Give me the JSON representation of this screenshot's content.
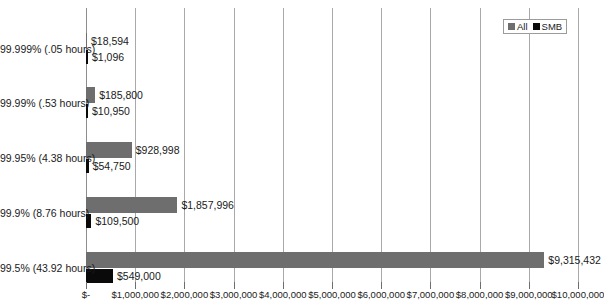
{
  "chart_data": {
    "type": "bar",
    "orientation": "horizontal",
    "title": "",
    "xlabel": "",
    "ylabel": "",
    "xlim": [
      0,
      10000000
    ],
    "grid": true,
    "legend_position": "top-right",
    "categories": [
      "99.999% (.05 hours)",
      "99.99% (.53 hours)",
      "99.95% (4.38 hours)",
      "99.9% (8.76 hours)",
      "99.5% (43.92 hours)"
    ],
    "xticks": [
      0,
      1000000,
      2000000,
      3000000,
      4000000,
      5000000,
      6000000,
      7000000,
      8000000,
      9000000,
      10000000
    ],
    "xticklabels": [
      "$-",
      "$1,000,000",
      "$2,000,000",
      "$3,000,000",
      "$4,000,000",
      "$5,000,000",
      "$6,000,000",
      "$7,000,000",
      "$8,000,000",
      "$9,000,000",
      "$10,000,000"
    ],
    "series": [
      {
        "name": "All",
        "color": "#6e6e6e",
        "values": [
          18594,
          185800,
          928998,
          1857996,
          9315432
        ],
        "labels": [
          "$18,594",
          "$185,800",
          "$928,998",
          "$1,857,996",
          "$9,315,432"
        ]
      },
      {
        "name": "SMB",
        "color": "#0a0a0a",
        "values": [
          1096,
          10950,
          54750,
          109500,
          549000
        ],
        "labels": [
          "$1,096",
          "$10,950",
          "$54,750",
          "$109,500",
          "$549,000"
        ]
      }
    ]
  },
  "legend": {
    "items": [
      {
        "label": "All",
        "color": "#6e6e6e"
      },
      {
        "label": "SMB",
        "color": "#0a0a0a"
      }
    ]
  }
}
